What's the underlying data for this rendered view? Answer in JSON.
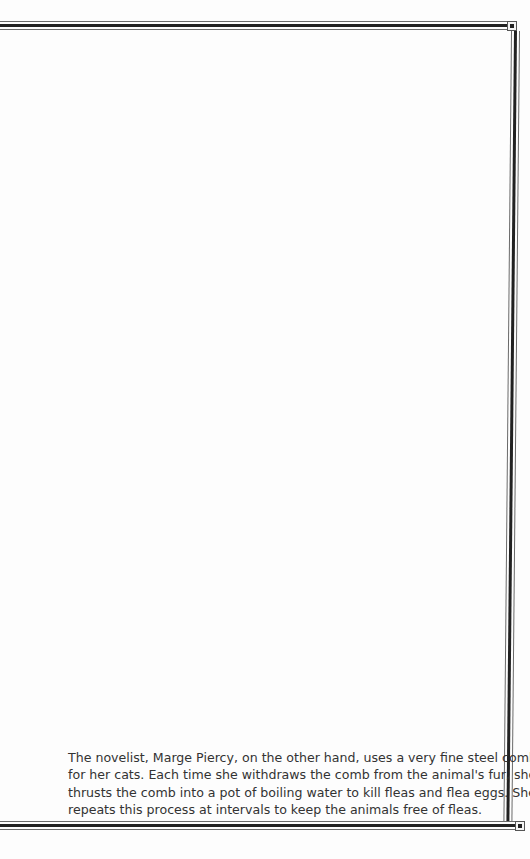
{
  "page": {
    "border": {
      "style": "double-rule frame with square corner ornaments",
      "rule_color": "#222222",
      "accent_color": "#6a6a6a"
    },
    "paragraph": {
      "lines": [
        "The novelist, Marge Piercy, on the other hand, uses a very fine steel comb",
        "for her cats. Each time she withdraws the comb from the animal's fur, she",
        "thrusts the comb into a pot of boiling water to kill fleas and flea eggs. She",
        "repeats this process at intervals to keep the animals free of fleas."
      ]
    }
  }
}
